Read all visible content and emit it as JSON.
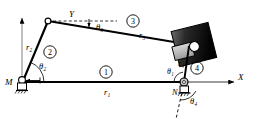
{
  "figure": {
    "type": "kinematic-linkage-diagram",
    "background_color": "#ffffff",
    "line_color": "#000000",
    "block_color": "#101010"
  },
  "axes": {
    "x_label": "X",
    "y_label": "Y",
    "origin_label": "M"
  },
  "joints": [
    {
      "name": "M",
      "label": "M",
      "type": "ground-pivot",
      "x": 22,
      "y": 82
    },
    {
      "name": "A",
      "label": "",
      "type": "pin-joint",
      "x": 48,
      "y": 21
    },
    {
      "name": "B",
      "label": "",
      "type": "pin-joint",
      "x": 191,
      "y": 44
    },
    {
      "name": "N",
      "label": "N",
      "type": "ground-pivot",
      "x": 184,
      "y": 82
    }
  ],
  "links": [
    {
      "id": "1",
      "badge": "①",
      "length_label": "r₁",
      "name": "ground-link"
    },
    {
      "id": "2",
      "badge": "②",
      "length_label": "r₂",
      "name": "crank-link"
    },
    {
      "id": "3",
      "badge": "③",
      "length_label": "r₃",
      "name": "coupler-link"
    },
    {
      "id": "4",
      "badge": "④",
      "length_label": "r₄",
      "name": "rocker-link"
    }
  ],
  "angles": [
    {
      "id": "theta1",
      "label": "θ₁",
      "name": "angle-theta-1"
    },
    {
      "id": "theta2",
      "label": "θ₂",
      "name": "angle-theta-2"
    },
    {
      "id": "theta3",
      "label": "θ₃",
      "name": "angle-theta-3"
    },
    {
      "id": "theta4",
      "label": "θ₄",
      "name": "angle-theta-4"
    }
  ],
  "labels": {
    "r1": "r₁",
    "r2": "r₂",
    "r3": "r₃",
    "r4": "r₄",
    "theta1": "θ₁",
    "theta2": "θ₂",
    "theta3": "θ₃",
    "theta4": "θ₄",
    "link1": "①",
    "link2": "②",
    "link3": "③",
    "link4": "④",
    "M": "M",
    "N": "N",
    "X": "X",
    "Y": "Y"
  },
  "slider_block": {
    "name": "slider-block",
    "fill_start": "#5a5a5a",
    "fill_end": "#050505",
    "rotation_deg": -14
  }
}
